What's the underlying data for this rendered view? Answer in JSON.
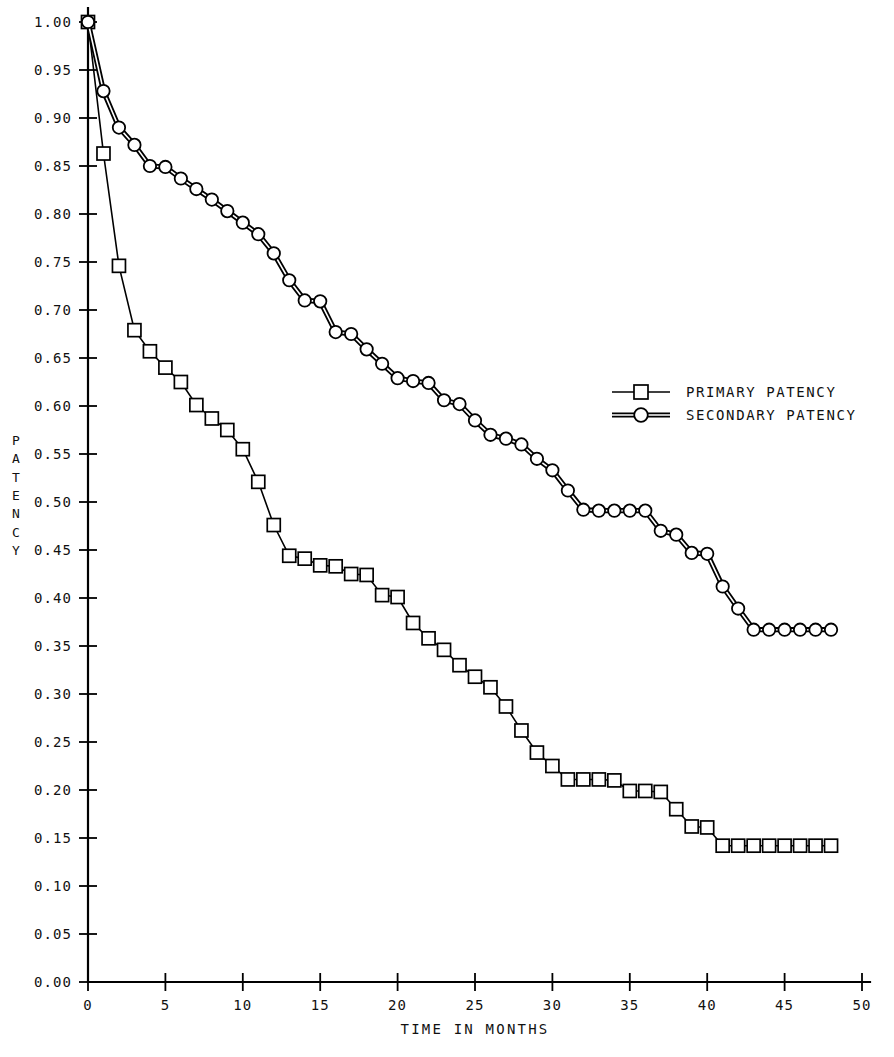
{
  "chart_data": {
    "type": "line",
    "title": "",
    "subtitle": "",
    "xlabel": "TIME IN MONTHS",
    "ylabel": "PATENCY",
    "xlim": [
      0,
      50
    ],
    "ylim": [
      0.0,
      1.0
    ],
    "grid": false,
    "legend_position": "right-middle",
    "xticks": [
      0,
      5,
      10,
      15,
      20,
      25,
      30,
      35,
      40,
      45,
      50
    ],
    "xtick_labels": [
      "0",
      "5",
      "10",
      "15",
      "20",
      "25",
      "30",
      "35",
      "40",
      "45",
      "50"
    ],
    "yticks": [
      0.0,
      0.05,
      0.1,
      0.15,
      0.2,
      0.25,
      0.3,
      0.35,
      0.4,
      0.45,
      0.5,
      0.55,
      0.6,
      0.65,
      0.7,
      0.75,
      0.8,
      0.85,
      0.9,
      0.95,
      1.0
    ],
    "ytick_labels": [
      "0.00",
      "0.05",
      "0.10",
      "0.15",
      "0.20",
      "0.25",
      "0.30",
      "0.35",
      "0.40",
      "0.45",
      "0.50",
      "0.55",
      "0.60",
      "0.65",
      "0.70",
      "0.75",
      "0.80",
      "0.85",
      "0.90",
      "0.95",
      "1.00"
    ],
    "series": [
      {
        "name": "PRIMARY PATENCY",
        "marker": "square",
        "line_style": "single",
        "x": [
          0,
          1,
          2,
          3,
          4,
          5,
          6,
          7,
          8,
          9,
          10,
          11,
          12,
          13,
          14,
          15,
          16,
          17,
          18,
          19,
          20,
          21,
          22,
          23,
          24,
          25,
          26,
          27,
          28,
          29,
          30,
          31,
          32,
          33,
          34,
          35,
          36,
          37,
          38,
          39,
          40,
          41,
          42,
          43,
          44,
          45,
          46,
          47,
          48
        ],
        "y": [
          1.0,
          0.863,
          0.746,
          0.679,
          0.657,
          0.64,
          0.625,
          0.601,
          0.587,
          0.575,
          0.555,
          0.521,
          0.476,
          0.444,
          0.441,
          0.434,
          0.433,
          0.425,
          0.424,
          0.403,
          0.401,
          0.374,
          0.358,
          0.346,
          0.33,
          0.318,
          0.307,
          0.287,
          0.262,
          0.239,
          0.225,
          0.211,
          0.211,
          0.211,
          0.21,
          0.199,
          0.199,
          0.198,
          0.18,
          0.162,
          0.161,
          0.142,
          0.142,
          0.142,
          0.142,
          0.142,
          0.142,
          0.142,
          0.142
        ]
      },
      {
        "name": "SECONDARY PATENCY",
        "marker": "circle",
        "line_style": "double",
        "x": [
          0,
          1,
          2,
          3,
          4,
          5,
          6,
          7,
          8,
          9,
          10,
          11,
          12,
          13,
          14,
          15,
          16,
          17,
          18,
          19,
          20,
          21,
          22,
          23,
          24,
          25,
          26,
          27,
          28,
          29,
          30,
          31,
          32,
          33,
          34,
          35,
          36,
          37,
          38,
          39,
          40,
          41,
          42,
          43,
          44,
          45,
          46,
          47,
          48
        ],
        "y": [
          1.0,
          0.928,
          0.89,
          0.872,
          0.85,
          0.849,
          0.837,
          0.826,
          0.815,
          0.803,
          0.791,
          0.779,
          0.759,
          0.731,
          0.71,
          0.709,
          0.677,
          0.675,
          0.659,
          0.644,
          0.629,
          0.626,
          0.624,
          0.606,
          0.602,
          0.585,
          0.57,
          0.566,
          0.56,
          0.545,
          0.533,
          0.512,
          0.492,
          0.491,
          0.491,
          0.491,
          0.491,
          0.47,
          0.466,
          0.447,
          0.446,
          0.412,
          0.389,
          0.367,
          0.367,
          0.367,
          0.367,
          0.367,
          0.367
        ]
      }
    ],
    "legend_entries": [
      {
        "label": "PRIMARY PATENCY",
        "marker": "square",
        "line_style": "single"
      },
      {
        "label": "SECONDARY PATENCY",
        "marker": "circle",
        "line_style": "double"
      }
    ],
    "colors": {
      "line": "#000000",
      "marker_fill": "#ffffff",
      "axis": "#000000",
      "background": "#ffffff",
      "text": "#111111"
    }
  }
}
